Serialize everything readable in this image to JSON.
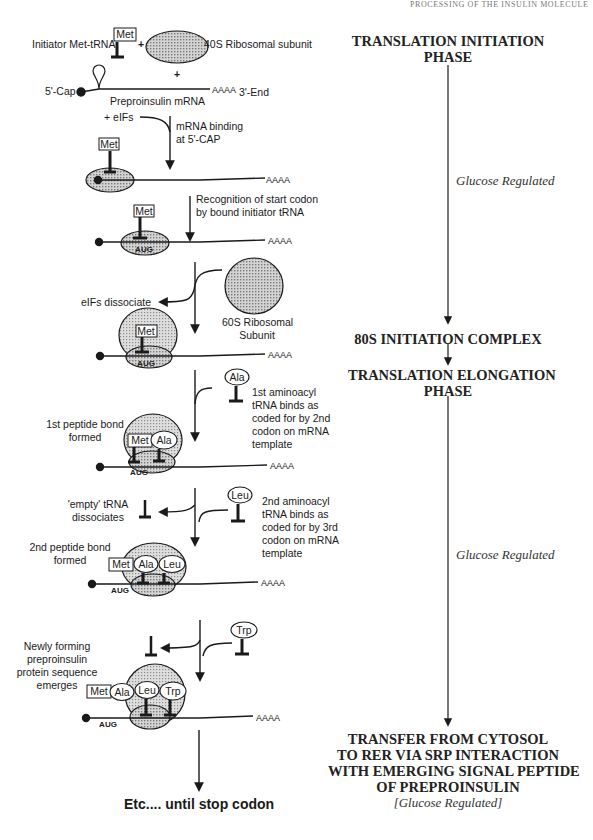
{
  "running_head": "PROCESSING OF THE INSULIN MOLECULE",
  "left_column": {
    "initiator_label": "Initiator Met-tRNA",
    "plus": "+",
    "subunit_40s_label": "40S Ribosomal subunit",
    "cap_label": "5'-Cap",
    "end_label": "3'-End",
    "mrna_label": "Preproinsulin mRNA",
    "polya": "AAAA",
    "eifs_add": "+ eIFs",
    "step_mrna_binding": [
      "mRNA  binding",
      "at 5'-CAP"
    ],
    "step_recognition": [
      "Recognition of start codon",
      "by bound initiator tRNA"
    ],
    "eifs_dissociate": "eIFs dissociate",
    "subunit_60s_label": [
      "60S Ribosomal",
      "Subunit"
    ],
    "codon_start": "AUG",
    "step_first_aminoacyl": [
      "1st aminoacyl",
      "tRNA binds as",
      "coded for by 2nd",
      "codon on mRNA",
      "template"
    ],
    "first_peptide": [
      "1st peptide bond",
      "formed"
    ],
    "empty_trna": [
      "'empty' tRNA",
      "dissociates"
    ],
    "step_second_aminoacyl": [
      "2nd aminoacyl",
      "tRNA binds as",
      "coded for by 3rd",
      "codon on mRNA",
      "template"
    ],
    "second_peptide": [
      "2nd peptide bond",
      "formed"
    ],
    "newly_forming": [
      "Newly forming",
      "preproinsulin",
      "protein sequence",
      "emerges"
    ],
    "final_step": "Etc.... until stop codon",
    "amino_acids": {
      "met": "Met",
      "ala": "Ala",
      "leu": "Leu",
      "trp": "Trp"
    }
  },
  "right_column": {
    "phase_initiation": [
      "TRANSLATION INITIATION",
      "PHASE"
    ],
    "glucose_1": "Glucose Regulated",
    "initiation_complex": "80S INITIATION COMPLEX",
    "phase_elongation": [
      "TRANSLATION ELONGATION",
      "PHASE"
    ],
    "glucose_2": "Glucose Regulated",
    "transfer": [
      "TRANSFER FROM CYTOSOL",
      "TO RER VIA SRP INTERACTION",
      "WITH EMERGING SIGNAL PEPTIDE",
      "OF PREPROINSULIN"
    ],
    "glucose_3": "[Glucose Regulated]"
  },
  "colors": {
    "line": "#1a1a1a",
    "ribosome_fill": "#bdbdbd",
    "ribosome_large_fill": "#cfcfcf"
  }
}
